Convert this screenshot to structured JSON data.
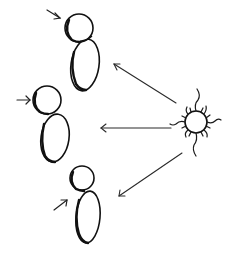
{
  "diagram": {
    "colors": {
      "background": "#ffffff",
      "stroke": "#111111",
      "ray": "#2a2a2a"
    },
    "light_source": {
      "icon": "sun-icon",
      "center": [
        196,
        122
      ],
      "radius": 11
    },
    "figures": [
      {
        "id": "figure-top",
        "head": {
          "cx": 79,
          "cy": 28,
          "r": 14
        },
        "body": {
          "cx": 85,
          "cy": 65,
          "rx": 14,
          "ry": 26
        },
        "pointer_arrow": {
          "from": [
            47,
            10
          ],
          "to": [
            60,
            18
          ]
        }
      },
      {
        "id": "figure-middle",
        "head": {
          "cx": 47,
          "cy": 100,
          "r": 14
        },
        "body": {
          "cx": 55,
          "cy": 140,
          "rx": 14,
          "ry": 23
        },
        "pointer_arrow": {
          "from": [
            17,
            100
          ],
          "to": [
            30,
            100
          ]
        }
      },
      {
        "id": "figure-bottom",
        "head": {
          "cx": 82,
          "cy": 178,
          "r": 12
        },
        "body": {
          "cx": 88,
          "cy": 217,
          "rx": 12,
          "ry": 26
        },
        "pointer_arrow": {
          "from": [
            54,
            210
          ],
          "to": [
            67,
            200
          ]
        }
      }
    ],
    "rays": [
      {
        "id": "ray-top",
        "from": [
          176,
          103
        ],
        "to": [
          114,
          64
        ]
      },
      {
        "id": "ray-middle",
        "from": [
          171,
          128
        ],
        "to": [
          101,
          128
        ]
      },
      {
        "id": "ray-bottom",
        "from": [
          182,
          153
        ],
        "to": [
          119,
          196
        ]
      }
    ]
  }
}
